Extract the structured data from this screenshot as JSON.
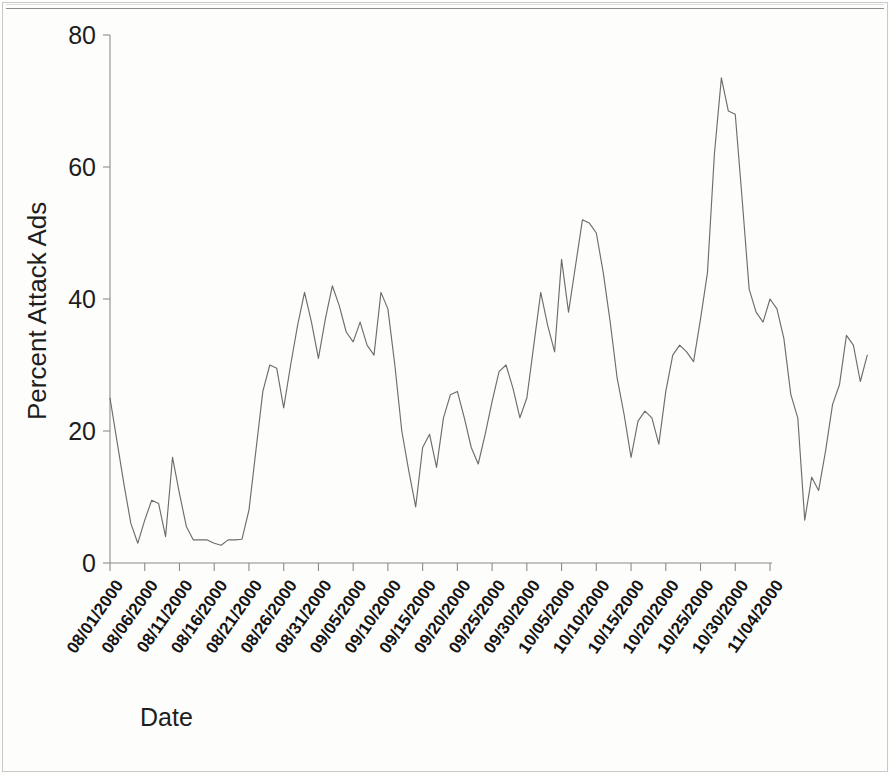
{
  "figure": {
    "frame": {
      "top_rule": true,
      "border": true
    },
    "background_color": "#fdfdfc",
    "line_color": "#6d6d6d",
    "axis_color": "#8c8c8c",
    "text_color": "#1a1a1a"
  },
  "chart_data": {
    "type": "line",
    "title": "",
    "subtitle": "",
    "xlabel": "Date",
    "ylabel": "Percent Attack Ads",
    "ylim": [
      0,
      80
    ],
    "yticks": [
      0,
      20,
      40,
      60,
      80
    ],
    "ytick_labels": [
      "0",
      "20",
      "40",
      "60",
      "80"
    ],
    "grid": false,
    "legend": false,
    "legend_position": "none",
    "xtick_rotation_deg": -55,
    "xtick_labels": [
      "08/01/2000",
      "08/06/2000",
      "08/11/2000",
      "08/16/2000",
      "08/21/2000",
      "08/26/2000",
      "08/31/2000",
      "09/05/2000",
      "09/10/2000",
      "09/15/2000",
      "09/20/2000",
      "09/25/2000",
      "09/30/2000",
      "10/05/2000",
      "10/10/2000",
      "10/15/2000",
      "10/20/2000",
      "10/25/2000",
      "10/30/2000",
      "11/04/2000"
    ],
    "x_start_date": "08/01/2000",
    "x_end_date": "11/04/2000",
    "x_tick_interval_days": 5,
    "series": [
      {
        "name": "Percent Attack Ads",
        "color": "#6d6d6d",
        "x_days_from_start": [
          0,
          1,
          2,
          3,
          4,
          5,
          6,
          7,
          8,
          9,
          10,
          11,
          12,
          13,
          14,
          15,
          16,
          17,
          18,
          19,
          20,
          21,
          22,
          23,
          24,
          25,
          26,
          27,
          28,
          29,
          30,
          31,
          32,
          33,
          34,
          35,
          36,
          37,
          38,
          39,
          40,
          41,
          42,
          43,
          44,
          45,
          46,
          47,
          48,
          49,
          50,
          51,
          52,
          53,
          54,
          55,
          56,
          57,
          58,
          59,
          60,
          61,
          62,
          63,
          64,
          65,
          66,
          67,
          68,
          69,
          70,
          71,
          72,
          73,
          74,
          75,
          76,
          77,
          78,
          79,
          80,
          81,
          82,
          83,
          84,
          85,
          86,
          87,
          88,
          89,
          90,
          91,
          92,
          93,
          94,
          95,
          96
        ],
        "values": [
          25.0,
          18.5,
          12.0,
          6.0,
          3.0,
          6.5,
          9.5,
          9.0,
          4.0,
          16.0,
          10.5,
          5.5,
          3.5,
          3.5,
          3.5,
          3.0,
          2.7,
          3.5,
          3.5,
          3.6,
          8.0,
          17.0,
          26.0,
          30.0,
          29.5,
          23.5,
          30.0,
          36.0,
          41.0,
          36.5,
          31.0,
          37.0,
          42.0,
          39.0,
          35.0,
          33.5,
          36.5,
          33.0,
          31.5,
          41.0,
          38.5,
          30.0,
          20.0,
          14.0,
          8.5,
          17.5,
          19.5,
          14.5,
          22.0,
          25.5,
          26.0,
          22.0,
          17.5,
          15.0,
          19.5,
          24.5,
          29.0,
          30.0,
          26.5,
          22.0,
          25.0,
          33.0,
          41.0,
          36.0,
          32.0,
          46.0,
          38.0,
          45.0,
          52.0,
          51.5,
          50.0,
          44.0,
          36.5,
          28.0,
          22.5,
          16.0,
          21.5,
          23.0,
          22.0,
          18.0,
          26.0,
          31.5,
          33.0,
          32.0,
          30.5,
          37.0,
          44.0,
          62.0,
          73.5,
          68.5,
          68.0,
          55.0,
          41.5,
          38.0,
          36.5,
          40.0,
          38.5
        ],
        "annotations": [
          {
            "label": "series maximum",
            "value": 73.5,
            "x_days_from_start": 88
          },
          {
            "label": "series minimum",
            "value": 2.7,
            "x_days_from_start": 16
          }
        ]
      }
    ],
    "values_tail": [
      {
        "x_days_from_start": 97,
        "value": 34.0
      },
      {
        "x_days_from_start": 98,
        "value": 25.5
      },
      {
        "x_days_from_start": 99,
        "value": 22.0
      },
      {
        "x_days_from_start": 100,
        "value": 6.5
      },
      {
        "x_days_from_start": 101,
        "value": 13.0
      },
      {
        "x_days_from_start": 102,
        "value": 11.0
      },
      {
        "x_days_from_start": 103,
        "value": 17.0
      },
      {
        "x_days_from_start": 104,
        "value": 24.0
      },
      {
        "x_days_from_start": 105,
        "value": 27.0
      },
      {
        "x_days_from_start": 106,
        "value": 34.5
      },
      {
        "x_days_from_start": 107,
        "value": 33.0
      },
      {
        "x_days_from_start": 108,
        "value": 27.5
      },
      {
        "x_days_from_start": 109,
        "value": 31.5
      }
    ]
  }
}
